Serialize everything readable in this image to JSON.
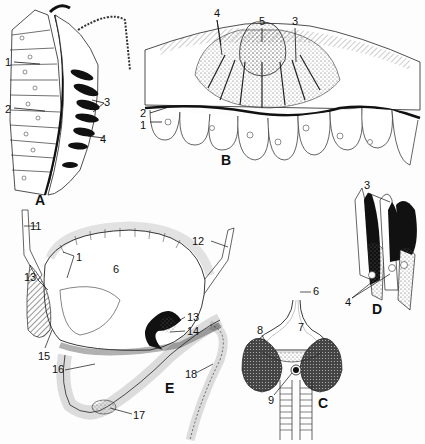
{
  "figure": {
    "panels": [
      {
        "id": "A",
        "labels": [
          "1",
          "2",
          "3",
          "4"
        ]
      },
      {
        "id": "B",
        "labels": [
          "1",
          "2",
          "3",
          "4",
          "5"
        ]
      },
      {
        "id": "C",
        "labels": [
          "6",
          "7",
          "8",
          "9"
        ]
      },
      {
        "id": "D",
        "labels": [
          "3",
          "4"
        ]
      },
      {
        "id": "E",
        "labels": [
          "1",
          "6",
          "11",
          "12",
          "13",
          "13",
          "14",
          "15",
          "16",
          "17",
          "18"
        ]
      }
    ],
    "panel_letters": {
      "A": "A",
      "B": "B",
      "C": "C",
      "D": "D",
      "E": "E"
    },
    "labels": {
      "a1": "1",
      "a2": "2",
      "a3": "3",
      "a4": "4",
      "b1": "1",
      "b2": "2",
      "b3": "3",
      "b4": "4",
      "b5": "5",
      "c6": "6",
      "c7": "7",
      "c8": "8",
      "c9": "9",
      "d3": "3",
      "d4": "4",
      "e1": "1",
      "e6": "6",
      "e11": "11",
      "e12": "12",
      "e13a": "13",
      "e13b": "13",
      "e14": "14",
      "e15": "15",
      "e16": "16",
      "e17": "17",
      "e18": "18"
    },
    "colors": {
      "ink": "#111111",
      "paper": "#fdfdfd",
      "stipple": "#888888"
    }
  }
}
